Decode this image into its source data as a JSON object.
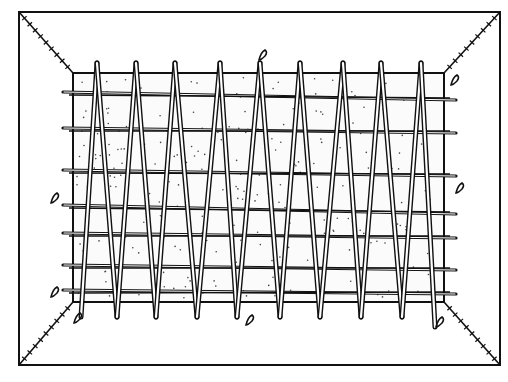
{
  "figure": {
    "title": "Woven rod grid over dotted slab in framed box",
    "colors": {
      "ink": "#111111",
      "paper": "#ffffff",
      "slab": "#fbfbfb"
    },
    "outer_frame": {
      "x1": 19,
      "y1": 12,
      "x2": 500,
      "y2": 365
    },
    "inner_slab": {
      "x1": 73,
      "y1": 73,
      "x2": 444,
      "y2": 302
    },
    "top_apexes_x": [
      97,
      136,
      175,
      220,
      260,
      300,
      343,
      381,
      421
    ],
    "top_apex_y": 63,
    "bottom_apexes_x": [
      117,
      156,
      197,
      237,
      280,
      320,
      361,
      402
    ],
    "bottom_apex_y": 317,
    "horizontal_rods_y": [
      [
        92,
        100
      ],
      [
        128,
        133
      ],
      [
        170,
        176
      ],
      [
        205,
        214
      ],
      [
        233,
        238
      ],
      [
        265,
        270
      ],
      [
        290,
        294
      ]
    ],
    "clips": [
      {
        "x": 263,
        "y": 55
      },
      {
        "x": 455,
        "y": 80
      },
      {
        "x": 55,
        "y": 198
      },
      {
        "x": 460,
        "y": 188
      },
      {
        "x": 55,
        "y": 292
      },
      {
        "x": 78,
        "y": 318
      },
      {
        "x": 250,
        "y": 320
      },
      {
        "x": 440,
        "y": 322
      }
    ]
  }
}
